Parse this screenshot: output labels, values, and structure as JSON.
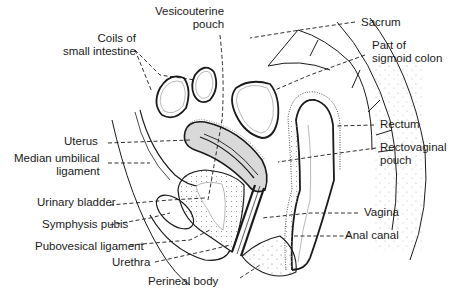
{
  "diagram": {
    "colors": {
      "ink": "#1a1a1a",
      "uterus_fill": "#d9d9d9",
      "stipple": "#8a8a8a",
      "background": "#ffffff"
    },
    "labels": {
      "coils_small_intestine": {
        "line1": "Coils of",
        "line2": "small intestine"
      },
      "vesicouterine_pouch": {
        "line1": "Vesicouterine",
        "line2": "pouch"
      },
      "sacrum": "Sacrum",
      "sigmoid_colon": {
        "line1": "Part of",
        "line2": "sigmoid colon"
      },
      "rectum": "Rectum",
      "rectovaginal_pouch": {
        "line1": "Rectovaginal",
        "line2": "pouch"
      },
      "uterus": "Uterus",
      "median_umbilical_ligament": {
        "line1": "Median umbilical",
        "line2": "ligament"
      },
      "urinary_bladder": "Urinary bladder",
      "symphysis_pubis": "Symphysis pubis",
      "pubovesical_ligament": "Pubovesical ligament",
      "urethra": "Urethra",
      "perineal_body": "Perineal body",
      "vagina": "Vagina",
      "anal_canal": "Anal canal"
    }
  }
}
